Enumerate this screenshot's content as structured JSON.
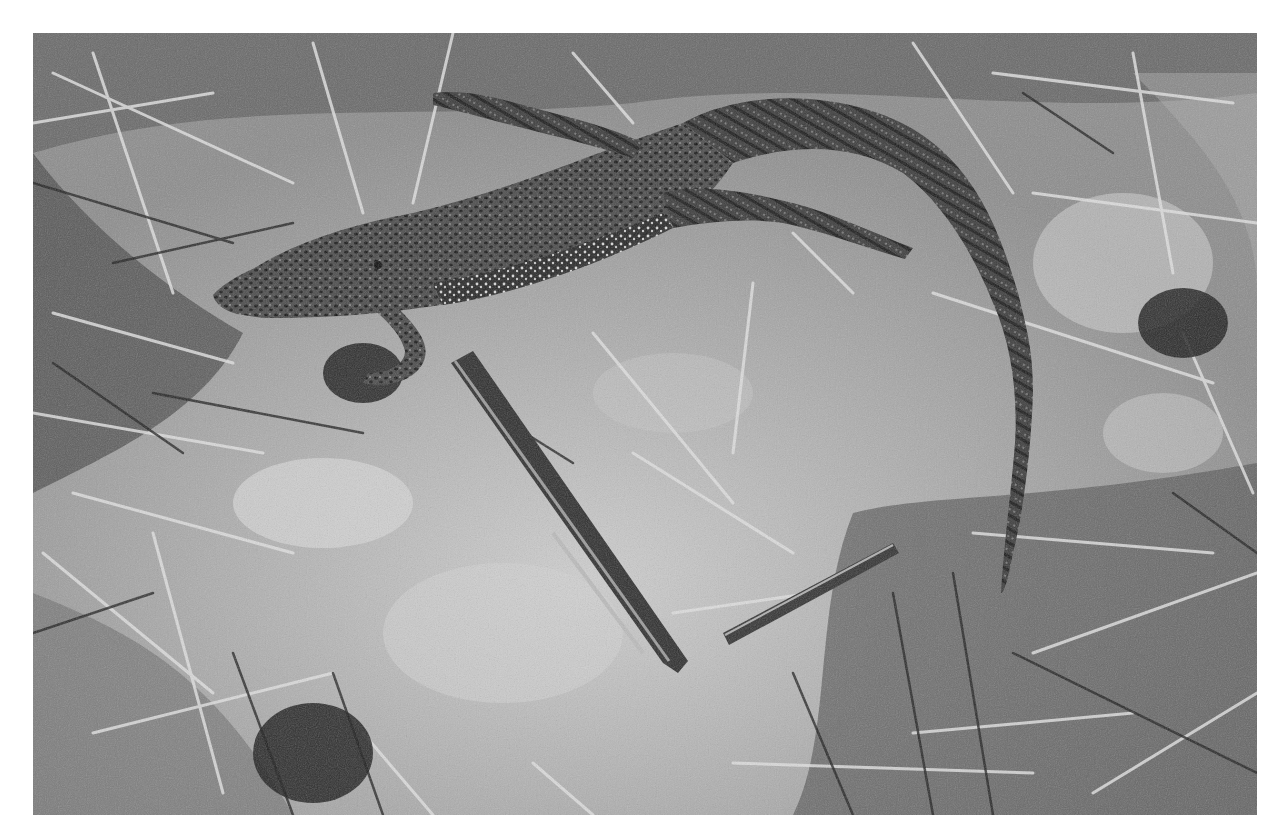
{
  "image": {
    "description": "Black-and-white photograph of a monitor lizard resting on dry grass and bare soil",
    "subject": "monitor-lizard",
    "palette": {
      "border": "#ffffff",
      "soil_light": "#c9c9c9",
      "soil_mid": "#9a9a9a",
      "shadow": "#1e1e1e",
      "lizard_body": "#3c3c3c",
      "lizard_spots_light": "#e6e6e6",
      "grass_light": "#dcdcdc",
      "grass_dark": "#2a2a2a"
    },
    "frame": {
      "x": 33,
      "y": 33,
      "width": 1224,
      "height": 782
    }
  }
}
